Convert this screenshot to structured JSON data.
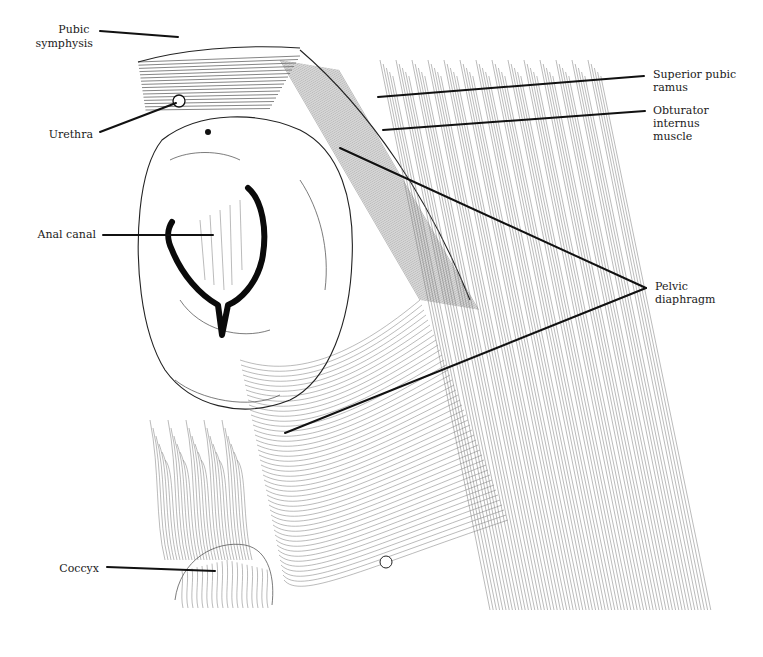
{
  "figure": {
    "style": "pen-and-ink line illustration",
    "colors": {
      "ink": "#111111",
      "background": "#ffffff"
    }
  },
  "labels": [
    {
      "id": "pubic-symphysis",
      "lines": [
        "Pubic",
        "symphysis"
      ],
      "side": "left"
    },
    {
      "id": "urethra",
      "lines": [
        "Urethra"
      ],
      "side": "left"
    },
    {
      "id": "anal-canal",
      "lines": [
        "Anal canal"
      ],
      "side": "left"
    },
    {
      "id": "coccyx",
      "lines": [
        "Coccyx"
      ],
      "side": "left"
    },
    {
      "id": "superior-pubic-ramus",
      "lines": [
        "Superior pubic",
        "ramus"
      ],
      "side": "right"
    },
    {
      "id": "obturator-internus-muscle",
      "lines": [
        "Obturator",
        "internus",
        "muscle"
      ],
      "side": "right"
    },
    {
      "id": "pelvic-diaphragm",
      "lines": [
        "Pelvic",
        "diaphragm"
      ],
      "side": "right"
    }
  ]
}
